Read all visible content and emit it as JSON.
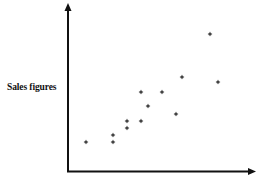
{
  "chart_data": {
    "type": "scatter",
    "title": "",
    "xlabel": "",
    "ylabel": "Sales figures",
    "grid": false,
    "legend": null,
    "ticks": {
      "x": [],
      "y": []
    },
    "axis_origin_px": [
      68,
      171
    ],
    "xlim": [
      0,
      185
    ],
    "ylim": [
      0,
      165
    ],
    "marker": "*",
    "marker_color": "#222222",
    "points": [
      {
        "x": 18,
        "y": 29
      },
      {
        "x": 45,
        "y": 36
      },
      {
        "x": 45,
        "y": 29
      },
      {
        "x": 59,
        "y": 50
      },
      {
        "x": 59,
        "y": 43
      },
      {
        "x": 73,
        "y": 50
      },
      {
        "x": 73,
        "y": 79
      },
      {
        "x": 80,
        "y": 65
      },
      {
        "x": 94,
        "y": 79
      },
      {
        "x": 108,
        "y": 57
      },
      {
        "x": 114,
        "y": 94
      },
      {
        "x": 142,
        "y": 137
      },
      {
        "x": 150,
        "y": 89
      }
    ]
  }
}
